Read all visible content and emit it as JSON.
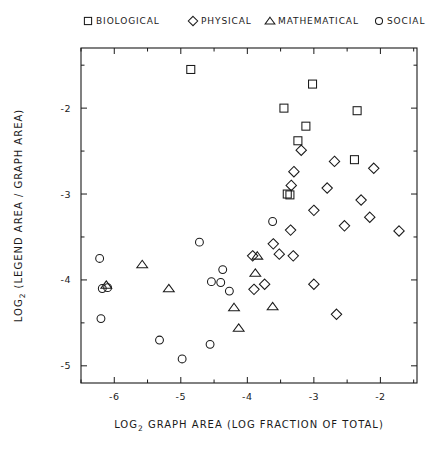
{
  "chart_data": {
    "type": "scatter",
    "title": "",
    "xlabel": "LOG₂ GRAPH AREA (LOG FRACTION OF TOTAL)",
    "ylabel": "LOG₂ (LEGEND AREA / GRAPH AREA)",
    "xlabel_parts": {
      "prefix": "LOG",
      "sub": "2",
      "rest": " GRAPH AREA  (LOG FRACTION OF TOTAL)"
    },
    "ylabel_parts": {
      "prefix": "LOG",
      "sub": "2",
      "rest": " (LEGEND AREA / GRAPH AREA)"
    },
    "xlim": [
      -6.5,
      -1.45
    ],
    "ylim": [
      -5.2,
      -1.3
    ],
    "grid": false,
    "legend_position": "top",
    "xticks": [
      -6,
      -5,
      -4,
      -3,
      -2
    ],
    "xticklabels": [
      "-6",
      "-5",
      "-4",
      "-3",
      "-2"
    ],
    "yticks": [
      -2,
      -3,
      -4,
      -5
    ],
    "yticklabels": [
      "-2",
      "-3",
      "-4",
      "-5"
    ],
    "x_minor_ticks": [
      -6.5,
      -5.5,
      -4.5,
      -3.5,
      -2.5,
      -1.5
    ],
    "y_minor_ticks": [
      -1.5,
      -2.5,
      -3.5,
      -4.5
    ],
    "series": [
      {
        "name": "BIOLOGICAL",
        "marker": "square",
        "points": [
          [
            -4.85,
            -1.55
          ],
          [
            -3.02,
            -1.72
          ],
          [
            -3.45,
            -2.0
          ],
          [
            -2.35,
            -2.03
          ],
          [
            -3.12,
            -2.21
          ],
          [
            -3.24,
            -2.38
          ],
          [
            -2.39,
            -2.6
          ],
          [
            -3.4,
            -3.0
          ],
          [
            -3.36,
            -3.01
          ]
        ]
      },
      {
        "name": "PHYSICAL",
        "marker": "diamond",
        "points": [
          [
            -3.19,
            -2.49
          ],
          [
            -3.3,
            -2.74
          ],
          [
            -2.69,
            -2.62
          ],
          [
            -2.1,
            -2.7
          ],
          [
            -3.34,
            -2.9
          ],
          [
            -2.8,
            -2.93
          ],
          [
            -2.29,
            -3.07
          ],
          [
            -3.0,
            -3.19
          ],
          [
            -2.16,
            -3.27
          ],
          [
            -2.54,
            -3.37
          ],
          [
            -3.35,
            -3.42
          ],
          [
            -1.72,
            -3.43
          ],
          [
            -3.61,
            -3.58
          ],
          [
            -3.92,
            -3.72
          ],
          [
            -3.52,
            -3.7
          ],
          [
            -3.31,
            -3.72
          ],
          [
            -3.74,
            -4.05
          ],
          [
            -3.0,
            -4.05
          ],
          [
            -2.66,
            -4.4
          ],
          [
            -3.9,
            -4.11
          ]
        ]
      },
      {
        "name": "MATHEMATICAL",
        "marker": "triangle",
        "points": [
          [
            -6.12,
            -4.06
          ],
          [
            -5.58,
            -3.82
          ],
          [
            -5.18,
            -4.1
          ],
          [
            -3.85,
            -3.72
          ],
          [
            -3.88,
            -3.92
          ],
          [
            -4.2,
            -4.32
          ],
          [
            -4.13,
            -4.56
          ],
          [
            -3.62,
            -4.31
          ]
        ]
      },
      {
        "name": "SOCIAL",
        "marker": "circle",
        "points": [
          [
            -6.22,
            -3.75
          ],
          [
            -6.18,
            -4.1
          ],
          [
            -6.1,
            -4.09
          ],
          [
            -6.2,
            -4.45
          ],
          [
            -5.32,
            -4.7
          ],
          [
            -4.98,
            -4.92
          ],
          [
            -4.72,
            -3.56
          ],
          [
            -4.37,
            -3.88
          ],
          [
            -4.54,
            -4.02
          ],
          [
            -4.4,
            -4.03
          ],
          [
            -4.27,
            -4.13
          ],
          [
            -4.56,
            -4.75
          ],
          [
            -3.62,
            -3.32
          ]
        ]
      }
    ]
  },
  "legend": {
    "items": [
      {
        "label": "BIOLOGICAL",
        "marker": "square"
      },
      {
        "label": "PHYSICAL",
        "marker": "diamond"
      },
      {
        "label": "MATHEMATICAL",
        "marker": "triangle"
      },
      {
        "label": "SOCIAL",
        "marker": "circle"
      }
    ]
  },
  "colors": {
    "ink": "#1a1a1a",
    "axis": "#333333",
    "background": "#ffffff"
  }
}
